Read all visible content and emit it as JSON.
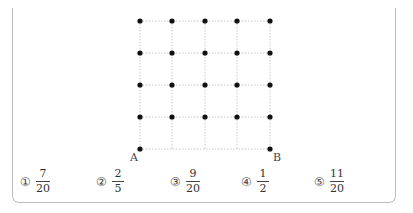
{
  "figure": {
    "grid_cols": 5,
    "grid_rows": 5,
    "point_A_label": "A",
    "point_B_label": "B"
  },
  "choices": [
    {
      "marker": "①",
      "numerator": "7",
      "denominator": "20"
    },
    {
      "marker": "②",
      "numerator": "2",
      "denominator": "5"
    },
    {
      "marker": "③",
      "numerator": "9",
      "denominator": "20"
    },
    {
      "marker": "④",
      "numerator": "1",
      "denominator": "2"
    },
    {
      "marker": "⑤",
      "numerator": "11",
      "denominator": "20"
    }
  ]
}
